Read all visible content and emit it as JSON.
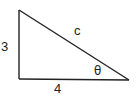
{
  "diagram": {
    "type": "right-triangle",
    "stroke_color": "#222222",
    "background": "#ffffff",
    "vertices": {
      "top_left": [
        19,
        10
      ],
      "bottom_left": [
        19,
        79
      ],
      "bottom_right": [
        129,
        80
      ]
    },
    "labels": {
      "vertical_side": "3",
      "horizontal_side": "4",
      "hypotenuse": "c",
      "angle": "θ"
    }
  }
}
